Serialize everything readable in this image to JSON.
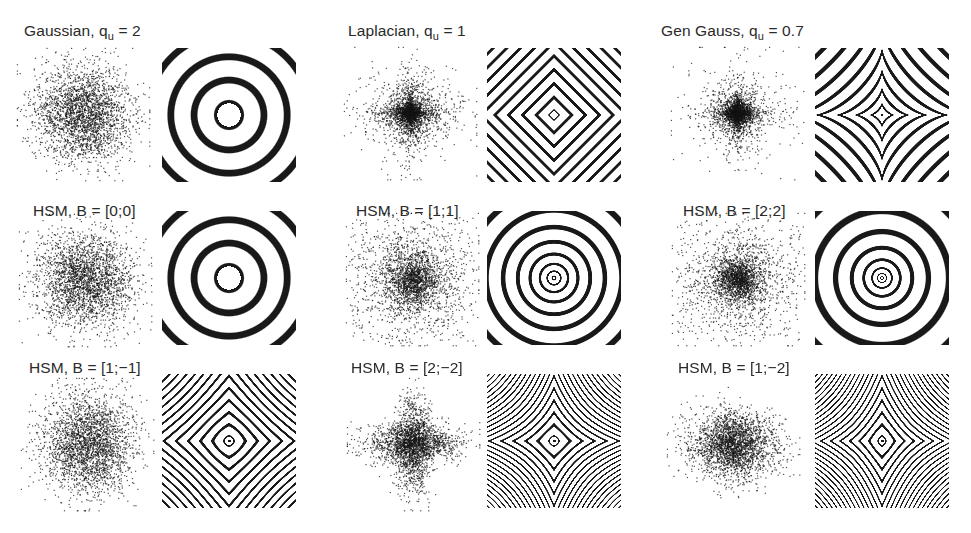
{
  "figure": {
    "background": "#ffffff",
    "ink_color": "#1a1a1a",
    "panels": [
      {
        "title_main": "Gaussian, q",
        "title_sub": "u",
        "title_tail": " = 2",
        "model": "gengauss",
        "q": 2,
        "B": null,
        "title_x": 24,
        "title_y": 22,
        "scatter_cx": 83,
        "scatter_cy": 114,
        "box_x": 162,
        "box_y": 48
      },
      {
        "title_main": "Laplacian, q",
        "title_sub": "u",
        "title_tail": " = 1",
        "model": "gengauss",
        "q": 1,
        "B": null,
        "title_x": 348,
        "title_y": 22,
        "scatter_cx": 410,
        "scatter_cy": 113,
        "box_x": 487,
        "box_y": 48
      },
      {
        "title_main": "Gen Gauss, q",
        "title_sub": "u",
        "title_tail": " = 0.7",
        "model": "gengauss",
        "q": 0.7,
        "B": null,
        "title_x": 661,
        "title_y": 22,
        "scatter_cx": 737,
        "scatter_cy": 113,
        "box_x": 815,
        "box_y": 48
      },
      {
        "title_main": "HSM, B = [0;0]",
        "title_sub": "",
        "title_tail": "",
        "model": "hsm",
        "q": null,
        "B": [
          0,
          0
        ],
        "title_x": 33,
        "title_y": 202,
        "scatter_cx": 85,
        "scatter_cy": 280,
        "box_x": 162,
        "box_y": 211
      },
      {
        "title_main": "HSM, B = [1;1]",
        "title_sub": "",
        "title_tail": "",
        "model": "hsm",
        "q": null,
        "B": [
          1,
          1
        ],
        "title_x": 356,
        "title_y": 202,
        "scatter_cx": 412,
        "scatter_cy": 279,
        "box_x": 487,
        "box_y": 211
      },
      {
        "title_main": "HSM, B = [2;2]",
        "title_sub": "",
        "title_tail": "",
        "model": "hsm",
        "q": null,
        "B": [
          2,
          2
        ],
        "title_x": 683,
        "title_y": 202,
        "scatter_cx": 738,
        "scatter_cy": 279,
        "box_x": 815,
        "box_y": 211
      },
      {
        "title_main": "HSM, B = [1;−1]",
        "title_sub": "",
        "title_tail": "",
        "model": "hsm",
        "q": null,
        "B": [
          1,
          -1
        ],
        "title_x": 29,
        "title_y": 359,
        "scatter_cx": 87,
        "scatter_cy": 444,
        "box_x": 162,
        "box_y": 374
      },
      {
        "title_main": "HSM, B = [2;−2]",
        "title_sub": "",
        "title_tail": "",
        "model": "hsm",
        "q": null,
        "B": [
          2,
          -2
        ],
        "title_x": 351,
        "title_y": 359,
        "scatter_cx": 413,
        "scatter_cy": 444,
        "box_x": 487,
        "box_y": 374
      },
      {
        "title_main": "HSM, B = [1;−2]",
        "title_sub": "",
        "title_tail": "",
        "model": "hsm",
        "q": null,
        "B": [
          1,
          -2
        ],
        "title_x": 678,
        "title_y": 359,
        "scatter_cx": 733,
        "scatter_cy": 444,
        "box_x": 815,
        "box_y": 374
      }
    ],
    "box_size": 134,
    "scatter_radius": 52,
    "scatter_points": 2600
  }
}
